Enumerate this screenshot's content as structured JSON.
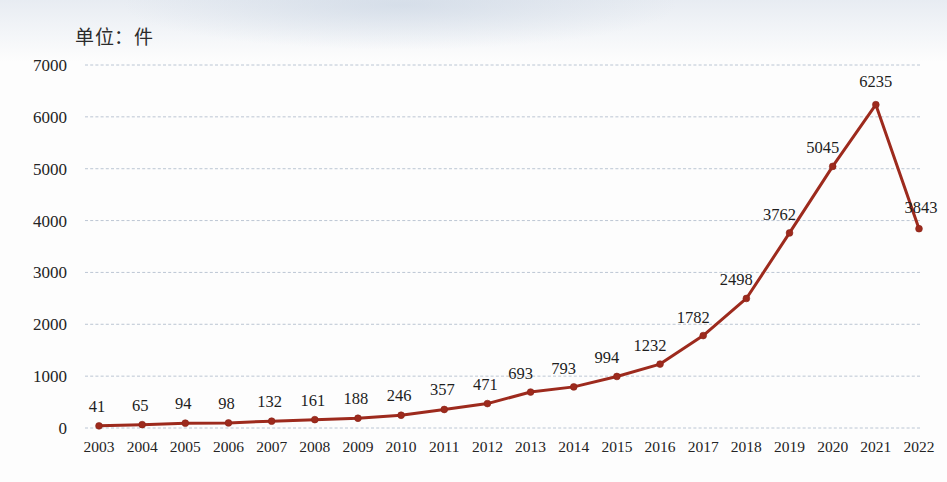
{
  "chart_data": {
    "type": "line",
    "title": "",
    "unit_note": "单位：件",
    "xlabel": "",
    "ylabel": "",
    "ylim": [
      0,
      7000
    ],
    "ytick_step": 1000,
    "yticks": [
      "0",
      "1000",
      "2000",
      "3000",
      "4000",
      "5000",
      "6000",
      "7000"
    ],
    "grid": true,
    "legend": "none",
    "marker": "circle",
    "series_color": "#9d2a1d",
    "grid_color": "#b9c4d2",
    "show_data_labels": true,
    "categories": [
      "2003",
      "2004",
      "2005",
      "2006",
      "2007",
      "2008",
      "2009",
      "2010",
      "2011",
      "2012",
      "2013",
      "2014",
      "2015",
      "2016",
      "2017",
      "2018",
      "2019",
      "2020",
      "2021",
      "2022"
    ],
    "values": [
      41,
      65,
      94,
      98,
      132,
      161,
      188,
      246,
      357,
      471,
      693,
      793,
      994,
      1232,
      1782,
      2498,
      3762,
      5045,
      6235,
      3843
    ],
    "series": [
      {
        "name": "件数",
        "values": [
          41,
          65,
          94,
          98,
          132,
          161,
          188,
          246,
          357,
          471,
          693,
          793,
          994,
          1232,
          1782,
          2498,
          3762,
          5045,
          6235,
          3843
        ]
      }
    ],
    "data_labels": [
      "41",
      "65",
      "94",
      "98",
      "132",
      "161",
      "188",
      "246",
      "357",
      "471",
      "693",
      "793",
      "994",
      "1232",
      "1782",
      "2498",
      "3762",
      "5045",
      "6235",
      "3843"
    ]
  }
}
